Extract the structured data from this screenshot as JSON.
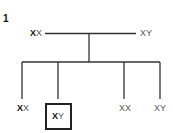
{
  "figure": {
    "number": "1",
    "parents": {
      "mother": {
        "bold_allele": "X",
        "rest": "X"
      },
      "father": {
        "bold_allele": "",
        "rest": "XY"
      }
    },
    "children": [
      {
        "bold_allele": "X",
        "rest": "X",
        "boxed": false
      },
      {
        "bold_allele": "X",
        "rest": "Y",
        "boxed": true
      },
      {
        "bold_allele": "",
        "rest": "XX",
        "boxed": false
      },
      {
        "bold_allele": "",
        "rest": "XY",
        "boxed": false
      }
    ]
  }
}
